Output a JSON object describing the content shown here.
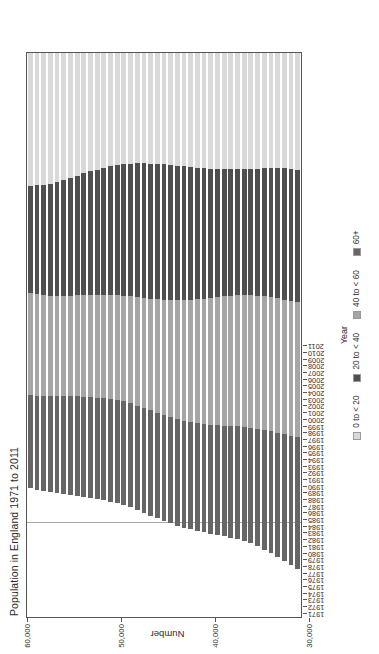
{
  "chart_data": {
    "type": "bar",
    "orientation": "vertical-stacked-rotated",
    "title": "Population in England 1971 to 2011",
    "xlabel": "Year",
    "ylabel": "Number",
    "ylim": [
      0,
      60000
    ],
    "yticks": [
      "0",
      "10,000",
      "20,000",
      "30,000",
      "40,000",
      "50,000",
      "60,000"
    ],
    "ytick_values": [
      0,
      10000,
      20000,
      30000,
      40000,
      50000,
      60000
    ],
    "grid": false,
    "legend_position": "bottom",
    "stacked": true,
    "note": "Values in thousands. Stack order from axis origin: 0 to < 20, 20 to < 40, 40 to < 60, 60+",
    "categories": [
      "1971",
      "1972",
      "1973",
      "1974",
      "1975",
      "1976",
      "1977",
      "1978",
      "1979",
      "1980",
      "1981",
      "1982",
      "1983",
      "1984",
      "1985",
      "1986",
      "1987",
      "1988",
      "1989",
      "1990",
      "1991",
      "1992",
      "1993",
      "1994",
      "1995",
      "1996",
      "1997",
      "1998",
      "1999",
      "2000",
      "2001",
      "2002",
      "2003",
      "2004",
      "2005",
      "2006",
      "2007",
      "2008",
      "2009",
      "2010",
      "2011"
    ],
    "series": [
      {
        "name": "0 to < 20",
        "color": "#d9d9d9",
        "values": [
          14120,
          14090,
          14020,
          13900,
          13730,
          13520,
          13280,
          13030,
          12800,
          12590,
          12400,
          12210,
          12040,
          11900,
          11810,
          11760,
          11740,
          11740,
          11760,
          11790,
          11840,
          11910,
          11990,
          12070,
          12150,
          12220,
          12280,
          12330,
          12360,
          12380,
          12390,
          12380,
          12360,
          12330,
          12300,
          12270,
          12250,
          12240,
          12250,
          12300,
          12400
        ]
      },
      {
        "name": "20 to < 40",
        "color": "#4f4f4f",
        "values": [
          11420,
          11560,
          11720,
          11900,
          12090,
          12300,
          12520,
          12740,
          12950,
          13160,
          13350,
          13530,
          13700,
          13860,
          14000,
          14120,
          14220,
          14300,
          14360,
          14390,
          14400,
          14370,
          14310,
          14220,
          14110,
          13980,
          13850,
          13720,
          13600,
          13500,
          13420,
          13380,
          13380,
          13420,
          13500,
          13610,
          13740,
          13870,
          13980,
          14070,
          14130
        ]
      },
      {
        "name": "40 to < 60",
        "color": "#a6a6a6",
        "values": [
          10880,
          10820,
          10770,
          10740,
          10720,
          10720,
          10730,
          10760,
          10800,
          10850,
          10910,
          10980,
          11060,
          11150,
          11260,
          11390,
          11540,
          11710,
          11890,
          12080,
          12270,
          12460,
          12650,
          12840,
          13020,
          13190,
          13350,
          13500,
          13640,
          13760,
          13870,
          13960,
          14040,
          14110,
          14170,
          14220,
          14260,
          14290,
          14310,
          14320,
          14330
        ]
      },
      {
        "name": "60+",
        "color": "#666666",
        "values": [
          9880,
          9990,
          10090,
          10190,
          10290,
          10390,
          10480,
          10570,
          10660,
          10740,
          10810,
          10870,
          10930,
          10980,
          11030,
          11080,
          11120,
          11160,
          11200,
          11240,
          11270,
          11300,
          11330,
          11360,
          11400,
          11450,
          11510,
          11580,
          11660,
          11760,
          11870,
          12000,
          12150,
          12320,
          12510,
          12720,
          12950,
          13200,
          13470,
          13750,
          14030
        ]
      }
    ],
    "totals": [
      46300,
      46460,
      46600,
      46730,
      46840,
      46930,
      47010,
      47100,
      47210,
      47340,
      47470,
      47590,
      47730,
      47890,
      48100,
      48350,
      48620,
      48910,
      49210,
      49500,
      49780,
      50040,
      50280,
      50490,
      50680,
      50840,
      50990,
      51130,
      51260,
      51400,
      51550,
      51720,
      51930,
      52180,
      52480,
      52820,
      53200,
      53600,
      54010,
      54440,
      54890
    ]
  },
  "legend": {
    "items": [
      {
        "label": "0 to < 20",
        "color": "#d9d9d9"
      },
      {
        "label": "20 to < 40",
        "color": "#4f4f4f"
      },
      {
        "label": "40 to < 60",
        "color": "#a6a6a6"
      },
      {
        "label": "60+",
        "color": "#666666"
      }
    ]
  },
  "axes": {
    "category_title": "Year",
    "value_title": "Number"
  },
  "colors": {
    "frame": "#555555",
    "gridline": "#aaaaaa",
    "text": "#2b2b2b",
    "background": "#ffffff"
  }
}
